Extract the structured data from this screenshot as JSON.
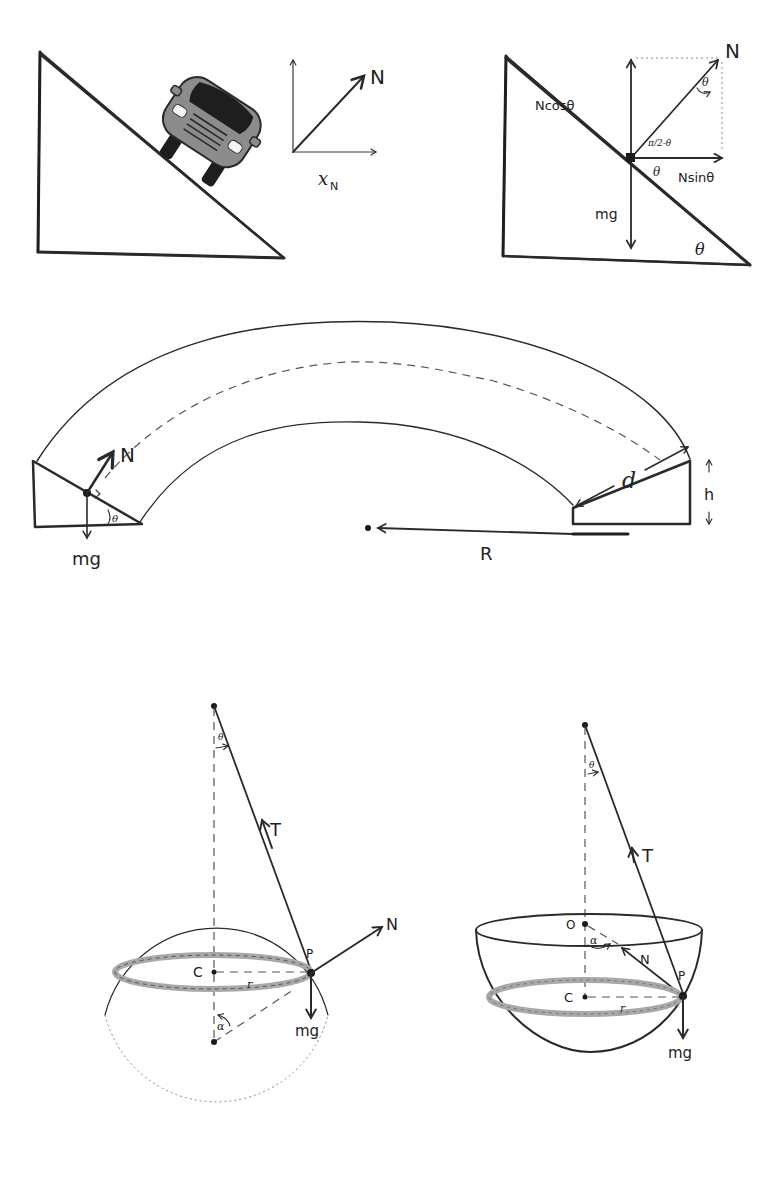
{
  "colors": {
    "ink": "#2a2a2a",
    "incline_fill": "#d4d4d4",
    "bank_fill": "#9a9a9a",
    "car_body": "#8c8c8c",
    "car_window": "#1e1e1e",
    "ring": "#a8a8a8"
  },
  "diagram1": {
    "title": "Car on inclined plane",
    "labels": {
      "normal": "N",
      "axis": "x",
      "axis_sub": "N"
    }
  },
  "diagram2": {
    "title": "Force decomposition on incline",
    "labels": {
      "normal": "N",
      "vertical_component": "Ncosθ",
      "horizontal_component": "Nsinθ",
      "weight": "mg",
      "angle_top": "θ",
      "angle_complement": "π/2-θ",
      "angle_base": "θ",
      "angle_incline": "θ"
    }
  },
  "diagram3": {
    "title": "Banked curved track",
    "labels": {
      "normal": "N",
      "weight": "mg",
      "angle": "θ",
      "slope_length": "d",
      "height": "h",
      "radius": "R"
    }
  },
  "diagram4": {
    "title": "Particle on outside of sphere, hanging string",
    "labels": {
      "angle_top": "θ",
      "tension": "T",
      "normal": "N",
      "point": "P",
      "center_circle": "C",
      "radius": "r",
      "angle_center": "α",
      "weight": "mg"
    }
  },
  "diagram5": {
    "title": "Particle inside hemispherical bowl, hanging string",
    "labels": {
      "angle_top": "θ",
      "tension": "T",
      "origin": "O",
      "angle_center": "α",
      "normal": "N",
      "point": "P",
      "center_circle": "C",
      "radius": "r",
      "weight": "mg"
    }
  }
}
